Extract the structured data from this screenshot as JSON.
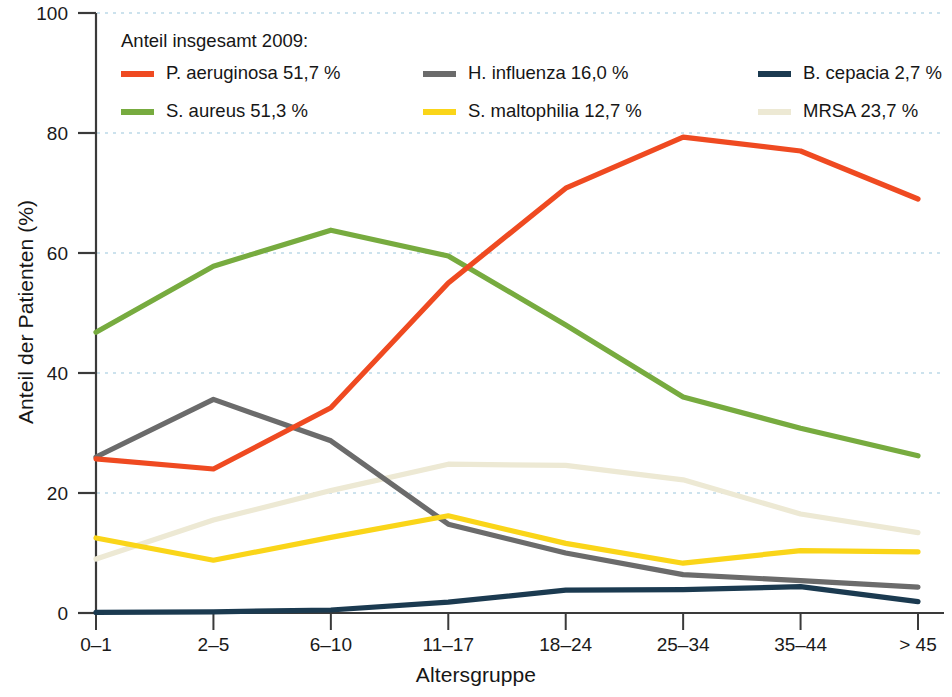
{
  "chart_data": {
    "type": "line",
    "title": "",
    "xlabel": "Altersgruppe",
    "ylabel": "Anteil der Patienten (%)",
    "legend_title": "Anteil insgesamt 2009:",
    "legend_position": "top-inside",
    "grid": "horizontal-dotted",
    "ylim": [
      0,
      100
    ],
    "yticks": [
      0,
      20,
      40,
      60,
      80,
      100
    ],
    "ytick_labels": [
      "0",
      "20",
      "40",
      "60",
      "80",
      "100"
    ],
    "categories": [
      "0–1",
      "2–5",
      "6–10",
      "11–17",
      "18–24",
      "25–34",
      "35–44",
      "> 45"
    ],
    "series": [
      {
        "name": "P. aeruginosa",
        "legend_label": "P. aeruginosa 51,7 %",
        "overall_share": "51,7 %",
        "color": "#ef4a21",
        "values": [
          25.7,
          24.0,
          34.2,
          55.0,
          70.8,
          79.3,
          77.0,
          69.0
        ]
      },
      {
        "name": "S. aureus",
        "legend_label": "S. aureus 51,3 %",
        "overall_share": "51,3 %",
        "color": "#77ab3f",
        "values": [
          46.8,
          57.8,
          63.8,
          59.5,
          48.0,
          36.0,
          30.8,
          26.2
        ]
      },
      {
        "name": "H. influenza",
        "legend_label": "H. influenza 16,0 %",
        "overall_share": "16,0 %",
        "color": "#6b6b6b",
        "values": [
          26.0,
          35.6,
          28.7,
          14.8,
          10.0,
          6.4,
          5.4,
          4.3
        ]
      },
      {
        "name": "S. maltophilia",
        "legend_label": "S. maltophilia 12,7 %",
        "overall_share": "12,7 %",
        "color": "#fad519",
        "values": [
          12.5,
          8.8,
          12.6,
          16.2,
          11.6,
          8.3,
          10.4,
          10.2
        ]
      },
      {
        "name": "B. cepacia",
        "legend_label": "B. cepacia 2,7 %",
        "overall_share": "2,7 %",
        "color": "#1b3a50",
        "values": [
          0.1,
          0.2,
          0.5,
          1.8,
          3.8,
          3.9,
          4.4,
          1.9
        ]
      },
      {
        "name": "MRSA",
        "legend_label": "MRSA 23,7 %",
        "overall_share": "23,7 %",
        "color": "#ede9d4",
        "values": [
          9.0,
          15.5,
          20.4,
          24.8,
          24.6,
          22.2,
          16.5,
          13.4
        ]
      }
    ]
  },
  "legend_layout": {
    "columns": [
      [
        "P. aeruginosa 51,7 %",
        "S. aureus 51,3 %"
      ],
      [
        "H. influenza 16,0 %",
        "S. maltophilia 12,7 %"
      ],
      [
        "B. cepacia 2,7 %",
        "MRSA 23,7 %"
      ]
    ]
  }
}
